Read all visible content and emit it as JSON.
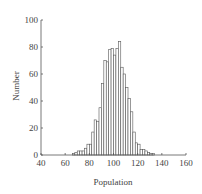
{
  "chart_data": {
    "type": "bar",
    "title": "",
    "xlabel": "Population",
    "ylabel": "Number",
    "xlim": [
      40,
      160
    ],
    "ylim": [
      0,
      100
    ],
    "xticks": [
      40,
      60,
      80,
      100,
      120,
      140,
      160
    ],
    "yticks": [
      0,
      20,
      40,
      60,
      80,
      100
    ],
    "grid": false,
    "legend": null,
    "bin_width": 2,
    "bins": [
      66,
      68,
      70,
      72,
      74,
      76,
      78,
      80,
      82,
      84,
      86,
      88,
      90,
      92,
      94,
      96,
      98,
      100,
      102,
      104,
      106,
      108,
      110,
      112,
      114,
      116,
      118,
      120,
      122,
      124,
      126,
      128,
      130,
      132
    ],
    "values": [
      1,
      2,
      3,
      3,
      3,
      5,
      8,
      8,
      17,
      26,
      25,
      35,
      53,
      70,
      69,
      78,
      79,
      74,
      79,
      84,
      65,
      60,
      50,
      42,
      32,
      17,
      9,
      8,
      4,
      4,
      3,
      2,
      1,
      1
    ]
  },
  "colors": {
    "bar_fill": "#ffffff",
    "bar_stroke": "#555555",
    "axis": "#555555"
  }
}
